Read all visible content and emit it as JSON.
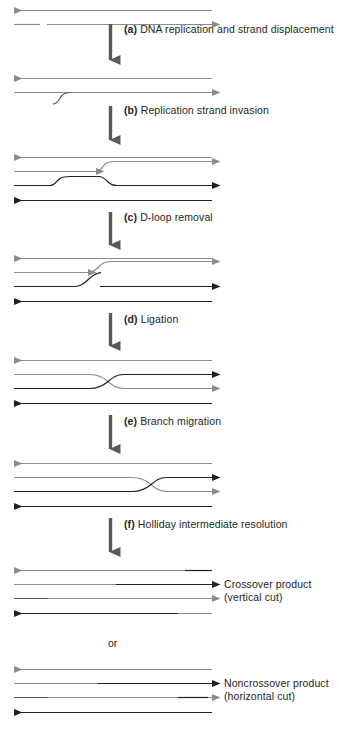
{
  "figure": {
    "type": "diagram",
    "background": "#ffffff",
    "ink_dark": "#231f20",
    "ink_gray": "#8c8c8c",
    "width": 332,
    "height": 735
  },
  "steps": [
    {
      "key": "a",
      "letter": "(a)",
      "label": "DNA replication and strand displacement",
      "lines": [
        "DNA replication",
        "and strand",
        "displacement"
      ],
      "arrow_x": 110,
      "arrow_top": 24,
      "arrow_bottom": 70,
      "text_x": 124,
      "text_y": 24
    },
    {
      "key": "b",
      "letter": "(b)",
      "label": "Replication strand invasion",
      "lines": [
        "Replication",
        "strand invasion"
      ],
      "arrow_x": 110,
      "arrow_top": 106,
      "arrow_bottom": 150,
      "text_x": 124,
      "text_y": 105
    },
    {
      "key": "c",
      "letter": "(c)",
      "label": "D-loop removal",
      "lines": [
        "D-loop",
        "removal"
      ],
      "arrow_x": 110,
      "arrow_top": 212,
      "arrow_bottom": 255,
      "text_x": 124,
      "text_y": 212
    },
    {
      "key": "d",
      "letter": "(d)",
      "label": "Ligation",
      "lines": [
        "Ligation"
      ],
      "arrow_x": 110,
      "arrow_top": 313,
      "arrow_bottom": 356,
      "text_x": 124,
      "text_y": 314
    },
    {
      "key": "e",
      "letter": "(e)",
      "label": "Branch migration",
      "lines": [
        "Branch",
        "migration"
      ],
      "arrow_x": 110,
      "arrow_top": 415,
      "arrow_bottom": 459,
      "text_x": 124,
      "text_y": 416
    },
    {
      "key": "f",
      "letter": "(f)",
      "label": "Holliday intermediate resolution",
      "lines": [
        "Holliday intermediate",
        "resolution"
      ],
      "arrow_x": 110,
      "arrow_top": 518,
      "arrow_bottom": 562,
      "text_x": 124,
      "text_y": 519
    }
  ],
  "products": [
    {
      "key": "crossover",
      "lines": [
        "Crossover product",
        "(vertical cut)"
      ],
      "label": "Crossover product (vertical cut)",
      "text_x": 224,
      "text_y": 584
    },
    {
      "key": "noncrossover",
      "lines": [
        "Noncrossover product",
        "(horizontal cut)"
      ],
      "label": "Noncrossover product (horizontal cut)",
      "text_x": 224,
      "text_y": 683
    }
  ],
  "separator": {
    "label": "or",
    "x": 108,
    "y": 637
  },
  "stages": [
    {
      "key": "initial",
      "caption": "Two duplexes: top duplex intact, bottom strand nicked",
      "y_top": 10,
      "y_bottom": 24
    },
    {
      "key": "after-replication",
      "caption": "Displaced strand forms free 3' tail",
      "y_top": 78,
      "y_bottom": 97
    },
    {
      "key": "d-loop",
      "caption": "Invading strand pairs with homologous duplex forming D-loop",
      "y_top": 157,
      "y_bottom": 207
    },
    {
      "key": "after-d-loop-removal",
      "caption": "Single crossing strand remains",
      "y_top": 258,
      "y_bottom": 308
    },
    {
      "key": "holliday",
      "caption": "Ligated Holliday junction",
      "y_top": 360,
      "y_bottom": 410
    },
    {
      "key": "branch-migrated",
      "caption": "Holliday junction after branch migration",
      "y_top": 463,
      "y_bottom": 513
    },
    {
      "key": "crossover-product",
      "caption": "Resolution by vertical cut",
      "y_top": 570,
      "y_bottom": 620
    },
    {
      "key": "noncrossover-product",
      "caption": "Resolution by horizontal cut",
      "y_top": 669,
      "y_bottom": 719
    }
  ]
}
